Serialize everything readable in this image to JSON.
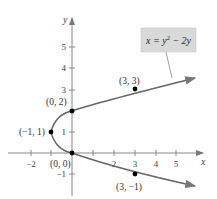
{
  "figure": {
    "equation": "x = y² − 2y",
    "equation_parts": {
      "lhs": "x = y",
      "exp": "2",
      "rhs": " − 2y"
    },
    "axis_labels": {
      "x": "x",
      "y": "y"
    },
    "x_ticks": [
      "−2",
      "−1",
      "1",
      "2",
      "3",
      "4",
      "5"
    ],
    "x_tick_labels_shown": [
      "−2",
      "2",
      "3",
      "4",
      "5"
    ],
    "y_ticks_labels": [
      "5",
      "4",
      "3",
      "1",
      "−1"
    ],
    "points": [
      {
        "label": "(3, 3)",
        "x": 3,
        "y": 3
      },
      {
        "label": "(0, 2)",
        "x": 0,
        "y": 2
      },
      {
        "label": "(−1, 1)",
        "x": -1,
        "y": 1
      },
      {
        "label": "(0, 0)",
        "x": 0,
        "y": 0
      },
      {
        "label": "(3, −1)",
        "x": 3,
        "y": -1
      }
    ],
    "colors": {
      "curve": "#666666",
      "axis": "#888888",
      "box": "#d9d9d9",
      "point": "#000000"
    }
  }
}
